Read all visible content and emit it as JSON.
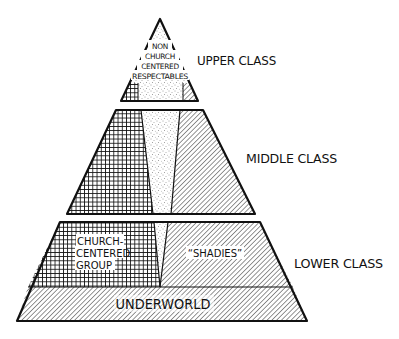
{
  "diagram": {
    "type": "stratified pyramid",
    "colors": {
      "ink": "#111111",
      "background": "#ffffff"
    },
    "tiers": [
      {
        "id": "upper",
        "label": "UPPER CLASS",
        "inner_label_lines": [
          "NON",
          "CHURCH",
          "CENTERED",
          "RESPECTABLES"
        ],
        "segments": [
          {
            "name": "church-centered",
            "pattern": "crosshatch"
          },
          {
            "name": "non-church-centered-respectables",
            "pattern": "stipple"
          },
          {
            "name": "shadies",
            "pattern": "diagonal-hatch"
          }
        ]
      },
      {
        "id": "middle",
        "label": "MIDDLE CLASS",
        "segments": [
          {
            "name": "church-centered",
            "pattern": "crosshatch"
          },
          {
            "name": "non-church-centered-respectables",
            "pattern": "stipple"
          },
          {
            "name": "shadies",
            "pattern": "diagonal-hatch"
          }
        ]
      },
      {
        "id": "lower",
        "label": "LOWER CLASS",
        "church_label_lines": [
          "CHURCH-",
          "CENTERED",
          "GROUP"
        ],
        "shadies_label": "“SHADIES”",
        "segments": [
          {
            "name": "church-centered-group",
            "pattern": "crosshatch"
          },
          {
            "name": "respectables-wedge",
            "pattern": "stipple"
          },
          {
            "name": "shadies",
            "pattern": "diagonal-hatch"
          }
        ]
      },
      {
        "id": "underworld",
        "label": "UNDERWORLD",
        "segments": [
          {
            "name": "underworld",
            "pattern": "diagonal-hatch"
          }
        ]
      }
    ]
  }
}
